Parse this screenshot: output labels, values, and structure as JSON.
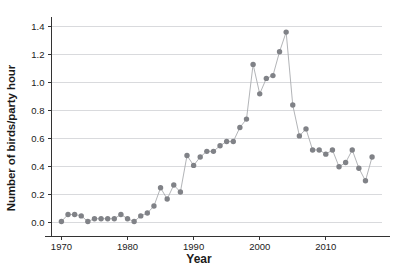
{
  "chart_data": {
    "type": "line",
    "title": "",
    "subtitle": "",
    "xlabel": "Year",
    "ylabel": "Number of birds/party hour",
    "xlim": [
      1968.5,
      2018.5
    ],
    "ylim": [
      -0.04,
      1.45
    ],
    "xticks": [
      1970,
      1980,
      1990,
      2000,
      2010
    ],
    "xticklabels": [
      "1970",
      "1980",
      "1990",
      "2000",
      "2010"
    ],
    "yticks": [
      0.0,
      0.2,
      0.4,
      0.6,
      0.8,
      1.0,
      1.2,
      1.4
    ],
    "yticklabels": [
      "0.0",
      "0.2",
      "0.4",
      "0.6",
      "0.8",
      "1.0",
      "1.2",
      "1.4"
    ],
    "grid": "horizontal",
    "legend": "none",
    "marker": "circle",
    "marker_color": "#808287",
    "line_color": "#a9abaf",
    "grid_color": "#d9dadd",
    "axis_color": "#333333",
    "x": [
      1970,
      1971,
      1972,
      1973,
      1974,
      1975,
      1976,
      1977,
      1978,
      1979,
      1980,
      1981,
      1982,
      1983,
      1984,
      1985,
      1986,
      1987,
      1988,
      1989,
      1990,
      1991,
      1992,
      1993,
      1994,
      1995,
      1996,
      1997,
      1998,
      1999,
      2000,
      2001,
      2002,
      2003,
      2004,
      2005,
      2006,
      2007,
      2008,
      2009,
      2010,
      2011,
      2012,
      2013,
      2014,
      2015,
      2016,
      2017
    ],
    "y": [
      0.01,
      0.06,
      0.06,
      0.05,
      0.01,
      0.03,
      0.03,
      0.03,
      0.03,
      0.06,
      0.03,
      0.01,
      0.05,
      0.07,
      0.12,
      0.25,
      0.17,
      0.27,
      0.22,
      0.48,
      0.41,
      0.47,
      0.51,
      0.51,
      0.55,
      0.58,
      0.58,
      0.68,
      0.74,
      1.13,
      0.92,
      1.03,
      1.05,
      1.22,
      1.36,
      0.84,
      0.62,
      0.67,
      0.52,
      0.52,
      0.49,
      0.52,
      0.4,
      0.43,
      0.52,
      0.39,
      0.3,
      0.47
    ],
    "series": [
      {
        "name": "Number of birds/party hour",
        "values": [
          0.01,
          0.06,
          0.06,
          0.05,
          0.01,
          0.03,
          0.03,
          0.03,
          0.03,
          0.06,
          0.03,
          0.01,
          0.05,
          0.07,
          0.12,
          0.25,
          0.17,
          0.27,
          0.22,
          0.48,
          0.41,
          0.47,
          0.51,
          0.51,
          0.55,
          0.58,
          0.58,
          0.68,
          0.74,
          1.13,
          0.92,
          1.03,
          1.05,
          1.22,
          1.36,
          0.84,
          0.62,
          0.67,
          0.52,
          0.52,
          0.49,
          0.52,
          0.4,
          0.43,
          0.52,
          0.39,
          0.3,
          0.47
        ]
      }
    ]
  }
}
